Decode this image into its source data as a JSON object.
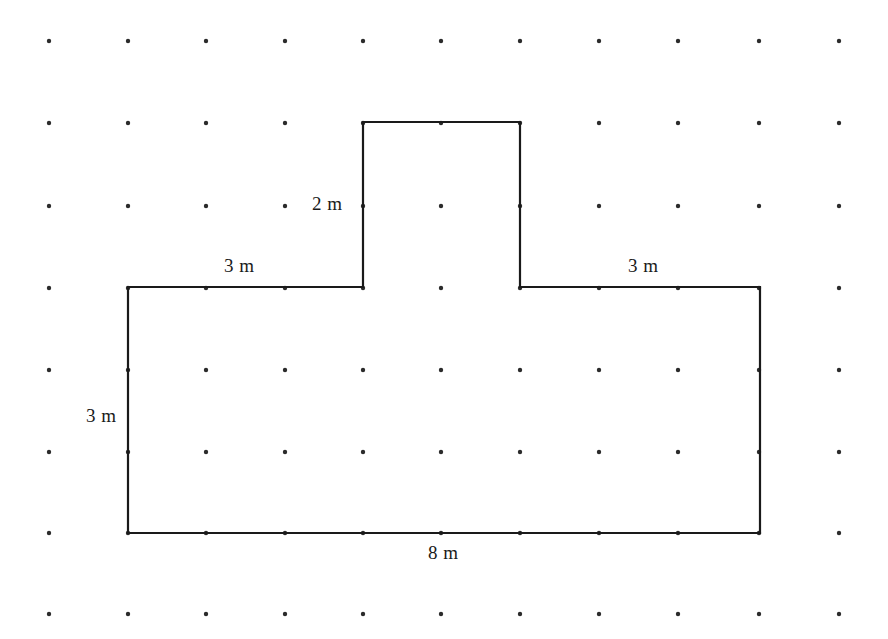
{
  "figure": {
    "kind": "geometry-dot-grid-polygon",
    "background_color": "#ffffff",
    "outline_color": "#1a1a1a",
    "dot_color": "#2b2b2b",
    "outline_width_px": 2.2,
    "dot_radius_px": 2.2
  },
  "grid": {
    "columns_x": [
      49,
      128,
      206,
      285,
      363,
      441,
      520,
      599,
      678,
      759,
      839
    ],
    "rows_y": [
      41,
      123,
      206,
      288,
      370,
      452,
      533,
      614
    ],
    "spacing_x_px": 79,
    "spacing_y_px": 82
  },
  "shape": {
    "name": "t-shape-polygon",
    "vertices": [
      [
        128,
        287
      ],
      [
        363,
        287
      ],
      [
        363,
        122
      ],
      [
        520,
        122
      ],
      [
        520,
        287
      ],
      [
        760,
        287
      ],
      [
        760,
        533
      ],
      [
        128,
        533
      ]
    ],
    "points_attr": "128,287 363,287 363,122 520,122 520,287 760,287 760,533 128,533"
  },
  "labels": {
    "tab_height": {
      "text": "2 m",
      "x": 312,
      "y": 194
    },
    "top_left_run": {
      "text": "3 m",
      "x": 224,
      "y": 256
    },
    "top_right_run": {
      "text": "3 m",
      "x": 628,
      "y": 256
    },
    "left_height": {
      "text": "3 m",
      "x": 86,
      "y": 406
    },
    "bottom_width": {
      "text": "8 m",
      "x": 428,
      "y": 543
    }
  },
  "measurements": {
    "base_width_m": 8,
    "base_height_m": 3,
    "tab_width_m": 2,
    "tab_height_m": 2,
    "left_shoulder_m": 3,
    "right_shoulder_m": 3,
    "unit": "m"
  }
}
